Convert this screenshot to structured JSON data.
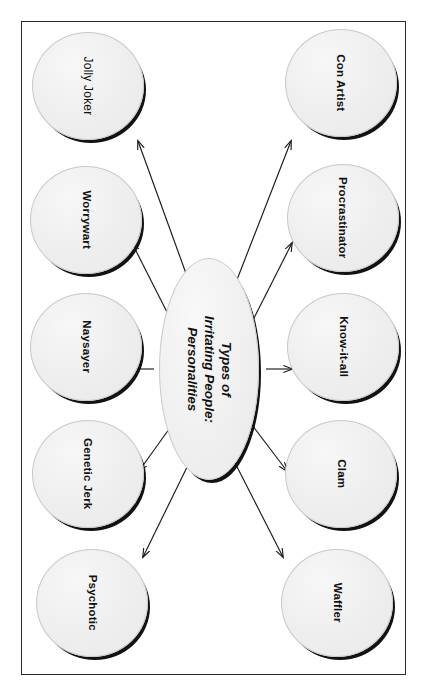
{
  "document": {
    "orientation": "rotated-90-clockwise",
    "page_background": "#ffffff",
    "frame_border_color": "#2b2b2b"
  },
  "diagram": {
    "type": "radial-hub-and-spoke",
    "center": {
      "id": "center",
      "title_lines": [
        "Types of",
        "Irritating People:",
        "Personalities"
      ],
      "title_full": "Types of Irritating People: Personalities",
      "shape": "ellipse",
      "fill": "#efefef",
      "shadow": "#121212"
    },
    "nodes": [
      {
        "id": "jolly-joker",
        "label": "Jolly Joker",
        "column": "left",
        "row": 1
      },
      {
        "id": "worrywart",
        "label": "Worrywart",
        "column": "left",
        "row": 2
      },
      {
        "id": "naysayer",
        "label": "Naysayer",
        "column": "left",
        "row": 3
      },
      {
        "id": "genetic-jerk",
        "label": "Genetic Jerk",
        "column": "left",
        "row": 4
      },
      {
        "id": "psychotic",
        "label": "Psychotic",
        "column": "left",
        "row": 5
      },
      {
        "id": "con-artist",
        "label": "Con Artist",
        "column": "right",
        "row": 1
      },
      {
        "id": "procrastinator",
        "label": "Procrastinator",
        "column": "right",
        "row": 2
      },
      {
        "id": "know-it-all",
        "label": "Know-it-all",
        "column": "right",
        "row": 3
      },
      {
        "id": "clam",
        "label": "Clam",
        "column": "right",
        "row": 4
      },
      {
        "id": "waffler",
        "label": "Waffler",
        "column": "right",
        "row": 5
      }
    ],
    "connector_count": 10,
    "connector_style": "single-headed arrow from center to each node"
  }
}
